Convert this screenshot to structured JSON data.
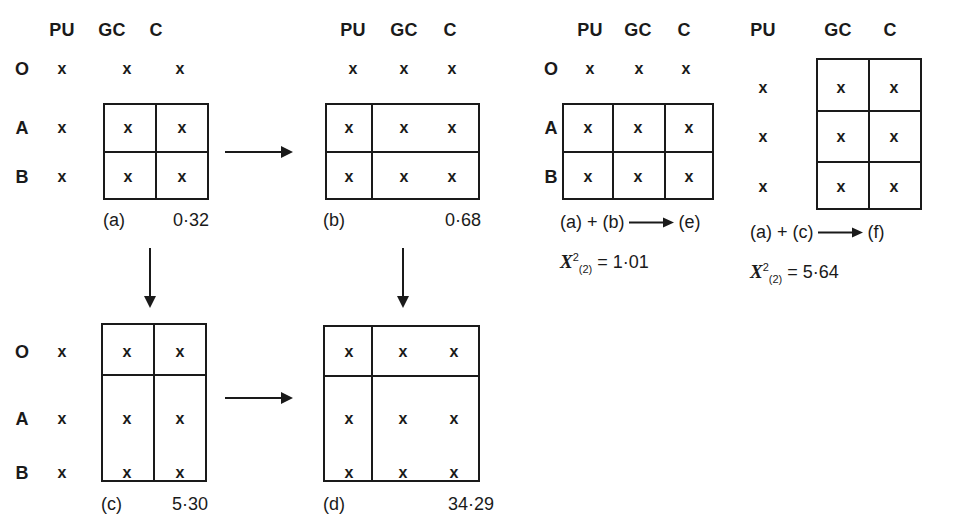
{
  "figure": {
    "column_headers": [
      "PU",
      "GC",
      "C"
    ],
    "row_labels": [
      "O",
      "A",
      "B"
    ],
    "cell_mark": "x",
    "ink_color": "#1a1a1a",
    "background_color": "#ffffff"
  },
  "panels": [
    {
      "id": "a",
      "caption": "(a)",
      "value": "0·32",
      "column_headers": [
        "PU",
        "GC",
        "C"
      ],
      "row_labels": [
        "O",
        "A",
        "B"
      ],
      "box_columns": [
        "GC",
        "C"
      ],
      "box_rows": [
        "A",
        "B"
      ],
      "vertical_dividers": [
        "GC|C"
      ],
      "horizontal_dividers": [
        "A|B"
      ]
    },
    {
      "id": "b",
      "caption": "(b)",
      "value": "0·68",
      "column_headers": [
        "PU",
        "GC",
        "C"
      ],
      "row_labels": [],
      "box_columns": [
        "PU",
        "GC",
        "C"
      ],
      "box_rows": [
        "A",
        "B"
      ],
      "vertical_dividers": [
        "PU|GC"
      ],
      "horizontal_dividers": [
        "A|B"
      ]
    },
    {
      "id": "c",
      "caption": "(c)",
      "value": "5·30",
      "column_headers": [],
      "row_labels": [
        "O",
        "A",
        "B"
      ],
      "box_columns": [
        "GC",
        "C"
      ],
      "box_rows": [
        "O",
        "A",
        "B"
      ],
      "vertical_dividers": [
        "GC|C"
      ],
      "horizontal_dividers": [
        "O|A"
      ]
    },
    {
      "id": "d",
      "caption": "(d)",
      "value": "34·29",
      "column_headers": [],
      "row_labels": [],
      "box_columns": [
        "PU",
        "GC",
        "C"
      ],
      "box_rows": [
        "O",
        "A",
        "B"
      ],
      "vertical_dividers": [
        "PU|GC"
      ],
      "horizontal_dividers": [
        "O|A"
      ]
    },
    {
      "id": "e",
      "caption": "(a) + (b)",
      "result": "(e)",
      "column_headers": [
        "PU",
        "GC",
        "C"
      ],
      "row_labels": [
        "O",
        "A",
        "B"
      ],
      "box_columns": [
        "PU",
        "GC",
        "C"
      ],
      "box_rows": [
        "A",
        "B"
      ],
      "vertical_dividers": [
        "PU|GC",
        "GC|C"
      ],
      "horizontal_dividers": [
        "A|B"
      ],
      "statistic_symbol": "X",
      "statistic_superscript": "2",
      "statistic_subscript": "(2)",
      "statistic_equals": "=",
      "statistic_value": "1·01"
    },
    {
      "id": "f",
      "caption": "(a) + (c)",
      "result": "(f)",
      "column_headers": [
        "PU",
        "GC",
        "C"
      ],
      "row_labels": [],
      "box_columns": [
        "GC",
        "C"
      ],
      "box_rows": [
        "O",
        "A",
        "B"
      ],
      "vertical_dividers": [
        "GC|C"
      ],
      "horizontal_dividers": [
        "O|A",
        "A|B"
      ],
      "statistic_symbol": "X",
      "statistic_superscript": "2",
      "statistic_subscript": "(2)",
      "statistic_equals": "=",
      "statistic_value": "5·64"
    }
  ],
  "arrows": [
    {
      "name": "a-to-b",
      "direction": "right"
    },
    {
      "name": "a-to-c",
      "direction": "down"
    },
    {
      "name": "b-to-d",
      "direction": "down"
    },
    {
      "name": "c-to-d",
      "direction": "right"
    }
  ]
}
